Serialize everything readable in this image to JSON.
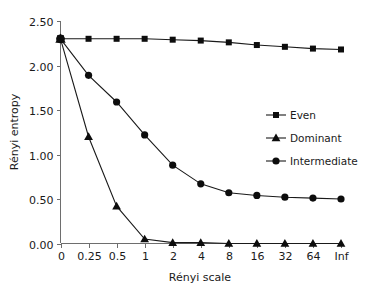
{
  "chart_data": {
    "type": "line",
    "title": "",
    "xlabel": "Rényi scale",
    "ylabel": "Rényi entropy",
    "categories": [
      "0",
      "0.25",
      "0.5",
      "1",
      "2",
      "4",
      "8",
      "16",
      "32",
      "64",
      "Inf"
    ],
    "ytick_labels": [
      "0.00",
      "0.50",
      "1.00",
      "1.50",
      "2.00",
      "2.50"
    ],
    "ytick_values": [
      0.0,
      0.5,
      1.0,
      1.5,
      2.0,
      2.5
    ],
    "ylim": [
      0.0,
      2.5
    ],
    "grid": false,
    "legend_position": "right-middle",
    "series": [
      {
        "name": "Even",
        "marker": "square",
        "color": "#0d0d0d",
        "values": [
          2.3,
          2.3,
          2.3,
          2.3,
          2.29,
          2.28,
          2.26,
          2.23,
          2.21,
          2.19,
          2.18
        ]
      },
      {
        "name": "Dominant",
        "marker": "triangle",
        "color": "#0d0d0d",
        "values": [
          2.3,
          1.2,
          0.42,
          0.05,
          0.01,
          0.01,
          0.0,
          0.0,
          0.0,
          0.0,
          0.0
        ]
      },
      {
        "name": "Intermediate",
        "marker": "circle",
        "color": "#0d0d0d",
        "values": [
          2.3,
          1.89,
          1.59,
          1.22,
          0.88,
          0.67,
          0.57,
          0.54,
          0.52,
          0.51,
          0.5
        ]
      }
    ]
  },
  "legend": {
    "items": [
      {
        "label": "Even"
      },
      {
        "label": "Dominant"
      },
      {
        "label": "Intermediate"
      }
    ]
  },
  "axes": {
    "x_title": "Rényi scale",
    "y_title": "Rényi entropy"
  }
}
